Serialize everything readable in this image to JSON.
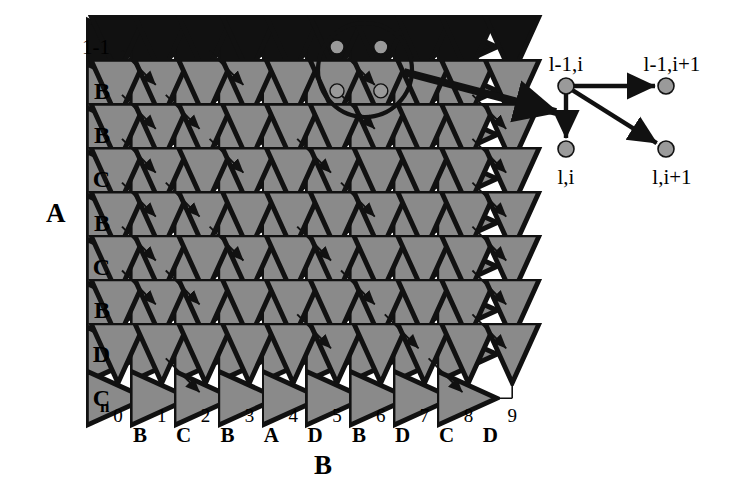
{
  "figure": {
    "type": "dynamic-programming-alignment-lattice",
    "axis_a_label": "A",
    "axis_b_label": "B",
    "row_top_label": "1-1",
    "row_corner_label": "C",
    "row_corner_subscript": "n"
  },
  "grid": {
    "cols": 10,
    "rows": 9,
    "x0": 118,
    "y0": 47,
    "dx": 43.8,
    "dy": 43.9,
    "line_color": "#111111",
    "arrow_gray": "#8a8a8a",
    "arrow_black": "#111111",
    "node_gray": "#9a9a9a"
  },
  "axis_a": {
    "labels": [
      "1-1",
      "B",
      "B",
      "C",
      "B",
      "C",
      "B",
      "D",
      "C"
    ]
  },
  "axis_b": {
    "numbers": [
      "0",
      "1",
      "2",
      "3",
      "4",
      "5",
      "6",
      "7",
      "8",
      "9"
    ],
    "letters": [
      "B",
      "C",
      "B",
      "A",
      "D",
      "B",
      "D",
      "C",
      "D"
    ]
  },
  "diagonals": [
    [
      0,
      0
    ],
    [
      0,
      2
    ],
    [
      0,
      5
    ],
    [
      1,
      0
    ],
    [
      1,
      1
    ],
    [
      1,
      5
    ],
    [
      1,
      8
    ],
    [
      2,
      0
    ],
    [
      2,
      2
    ],
    [
      2,
      4
    ],
    [
      2,
      8
    ],
    [
      3,
      0
    ],
    [
      3,
      1
    ],
    [
      3,
      5
    ],
    [
      3,
      8
    ],
    [
      4,
      0
    ],
    [
      4,
      2
    ],
    [
      4,
      4
    ],
    [
      4,
      8
    ],
    [
      5,
      0
    ],
    [
      5,
      1
    ],
    [
      5,
      5
    ],
    [
      5,
      8
    ],
    [
      6,
      4
    ],
    [
      6,
      6
    ],
    [
      6,
      8
    ],
    [
      7,
      1
    ],
    [
      7,
      7
    ]
  ],
  "highlight": {
    "circle_cx": 365,
    "circle_cy": 70,
    "circle_r": 47,
    "nodes": [
      [
        0,
        5
      ],
      [
        0,
        6
      ],
      [
        1,
        5
      ],
      [
        1,
        6
      ]
    ]
  },
  "pointer": {
    "x1": 404,
    "y1": 72,
    "x2": 556,
    "y2": 112
  },
  "inset": {
    "nodes": [
      {
        "id": "tl",
        "cx": 566,
        "cy": 86,
        "label": "l-1,i",
        "lx": 566,
        "ly": 54
      },
      {
        "id": "tr",
        "cx": 666,
        "cy": 86,
        "label": "l-1,i+1",
        "lx": 672,
        "ly": 54
      },
      {
        "id": "bl",
        "cx": 566,
        "cy": 149,
        "label": "l,i",
        "lx": 566,
        "ly": 167
      },
      {
        "id": "br",
        "cx": 666,
        "cy": 149,
        "label": "l,i+1",
        "lx": 672,
        "ly": 167
      }
    ],
    "edges": [
      {
        "from": "tl",
        "to": "tr"
      },
      {
        "from": "tl",
        "to": "bl"
      },
      {
        "from": "tl",
        "to": "br"
      }
    ]
  }
}
